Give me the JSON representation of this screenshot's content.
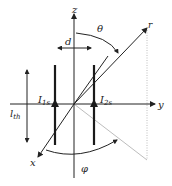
{
  "diagram": {
    "axes": {
      "z": "z",
      "y": "y",
      "x": "x",
      "r": "r"
    },
    "angles": {
      "theta": "θ",
      "phi": "φ"
    },
    "dimensions": {
      "d": "d",
      "lth_main": "l",
      "lth_sub": "th"
    },
    "currents": [
      {
        "main": "I",
        "sub": "1s"
      },
      {
        "main": "I",
        "sub": "2s"
      }
    ],
    "colors": {
      "line": "#222222",
      "rod": "#1a1a1a",
      "guide": "#bdbdbd"
    }
  }
}
